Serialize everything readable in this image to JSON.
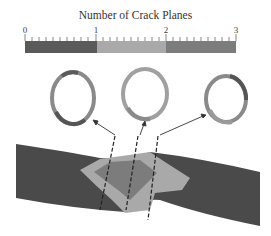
{
  "colorbar": {
    "title": "Number of Crack Planes",
    "min": 0,
    "max": 3,
    "tick_labels": [
      "0",
      "1",
      "2",
      "3"
    ],
    "segments": [
      {
        "from": 0,
        "to": 1,
        "color": "#5a5a5a"
      },
      {
        "from": 1,
        "to": 2,
        "color": "#a9a9a9"
      },
      {
        "from": 2,
        "to": 3,
        "color": "#7c7c7c"
      }
    ]
  },
  "rings": [
    {
      "name": "left-ring",
      "position": "left"
    },
    {
      "name": "center-ring",
      "position": "center"
    },
    {
      "name": "right-ring",
      "position": "right"
    }
  ],
  "specimen": {
    "description": "Tubular specimen with crack region colored by number of crack planes",
    "base_color": "#4a4a4a",
    "crack_region_colors": [
      "#a9a9a9",
      "#7c7c7c"
    ]
  }
}
